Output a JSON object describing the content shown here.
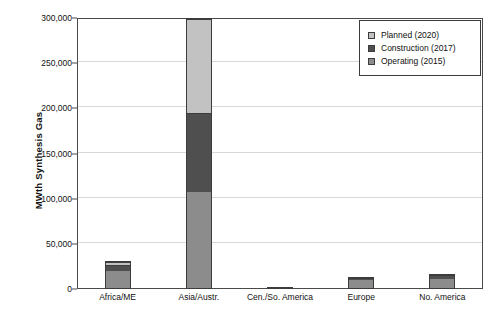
{
  "chart_data": {
    "type": "bar",
    "stacked": true,
    "title": "",
    "xlabel": "",
    "ylabel": "MWth Synthesis Gas",
    "ylim": [
      0,
      300000
    ],
    "ytick_labels": [
      "0",
      "50,000",
      "100,000",
      "150,000",
      "200,000",
      "250,000",
      "300,000"
    ],
    "ytick_values": [
      0,
      50000,
      100000,
      150000,
      200000,
      250000,
      300000
    ],
    "grid": true,
    "legend_position": "top-right",
    "categories": [
      "Africa/ME",
      "Asia/Austr.",
      "Cen./So. America",
      "Europe",
      "No. America"
    ],
    "series": [
      {
        "name": "Operating (2015)",
        "color": "#8c8c8c",
        "values": [
          22000,
          108000,
          1200,
          11500,
          13000
        ]
      },
      {
        "name": "Construction (2017)",
        "color": "#4f4f4f",
        "values": [
          7000,
          87000,
          900,
          1800,
          3200
        ]
      },
      {
        "name": "Planned (2020)",
        "color": "#c2c2c2",
        "values": [
          1500,
          105000,
          0,
          0,
          0
        ]
      }
    ],
    "legend_order_top_to_bottom": [
      "Planned (2020)",
      "Construction (2017)",
      "Operating (2015)"
    ]
  },
  "legend": {
    "items": [
      {
        "label": "Planned (2020)",
        "color": "#c2c2c2"
      },
      {
        "label": "Construction (2017)",
        "color": "#4f4f4f"
      },
      {
        "label": "Operating (2015)",
        "color": "#8c8c8c"
      }
    ]
  },
  "axis": {
    "y_title": "MWth Synthesis Gas"
  }
}
